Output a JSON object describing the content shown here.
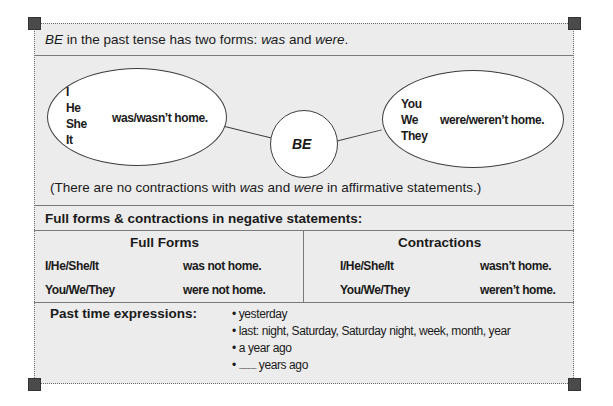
{
  "intro": {
    "subject": "BE",
    "text_mid": " in the past tense has two forms: ",
    "form1": "was",
    "text_and": " and ",
    "form2": "were",
    "text_end": "."
  },
  "diagram": {
    "center": "BE",
    "left": {
      "pronouns": [
        "I",
        "He",
        "She",
        "It"
      ],
      "verb": "was/wasn’t home."
    },
    "right": {
      "pronouns": [
        "You",
        "We",
        "They"
      ],
      "verb": "were/weren’t home."
    }
  },
  "note": {
    "start": "(There are no contractions with ",
    "w1": "was",
    "mid": " and ",
    "w2": "were",
    "end": " in affirmative statements.)"
  },
  "negative": {
    "heading": "Full forms & contractions in negative statements:",
    "full_forms": {
      "title": "Full Forms",
      "rows": [
        {
          "subject": "I/He/She/It",
          "verb": "was not home."
        },
        {
          "subject": "You/We/They",
          "verb": "were not home."
        }
      ]
    },
    "contractions": {
      "title": "Contractions",
      "rows": [
        {
          "subject": "I/He/She/It",
          "verb": "wasn’t home."
        },
        {
          "subject": "You/We/They",
          "verb": "weren’t home."
        }
      ]
    }
  },
  "past_time": {
    "label": "Past time expressions:",
    "bullet": "•",
    "items": [
      "yesterday",
      "last: night, Saturday, Saturday night, week, month, year",
      "a year ago"
    ],
    "blank_item": {
      "blank": "..............",
      "suffix": " years ago"
    }
  },
  "colors": {
    "panel_bg": "#ececec",
    "corner": "#4a4a4a",
    "rule": "#7a7a7a"
  }
}
